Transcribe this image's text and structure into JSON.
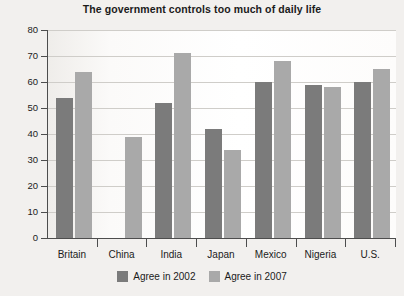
{
  "chart_data": {
    "type": "bar",
    "title": "The government controls too much of daily life",
    "xlabel": "",
    "ylabel": "",
    "ylim": [
      0,
      80
    ],
    "yticks": [
      0,
      10,
      20,
      30,
      40,
      50,
      60,
      70,
      80
    ],
    "grid": true,
    "legend_position": "bottom",
    "categories": [
      "Britain",
      "China",
      "India",
      "Japan",
      "Mexico",
      "Nigeria",
      "U.S."
    ],
    "series": [
      {
        "name": "Agree in 2002",
        "color": "#7b7b7b",
        "values": [
          54,
          null,
          52,
          42,
          60,
          59,
          60
        ]
      },
      {
        "name": "Agree in 2007",
        "color": "#a9a9a9",
        "values": [
          64,
          39,
          71,
          34,
          68,
          58,
          65
        ]
      }
    ]
  },
  "legend": {
    "items": [
      {
        "label": "Agree in 2002",
        "color": "#7b7b7b"
      },
      {
        "label": "Agree in 2007",
        "color": "#a9a9a9"
      }
    ]
  }
}
